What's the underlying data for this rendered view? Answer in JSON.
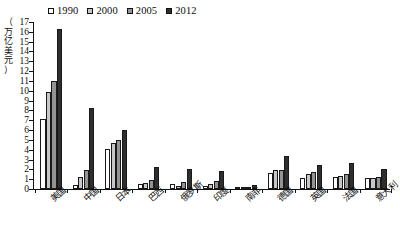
{
  "chart_data": {
    "type": "bar",
    "title": "",
    "subtitle": "",
    "xlabel": "",
    "ylabel": "（万亿美元）",
    "ylabel_chars": [
      "（",
      "万",
      "亿",
      "美",
      "元",
      "）"
    ],
    "ylim": [
      0,
      17
    ],
    "ytick_values": [
      0,
      1,
      2,
      3,
      4,
      5,
      6,
      7,
      8,
      9,
      10,
      11,
      12,
      13,
      14,
      15,
      16,
      17
    ],
    "ytick_labels": [
      "0",
      "1",
      "2",
      "3",
      "4",
      "5",
      "6",
      "7",
      "8",
      "9",
      "10",
      "11",
      "12",
      "13",
      "14",
      "15",
      "16",
      "17"
    ],
    "grid": false,
    "legend_position": "top",
    "categories": [
      "美国",
      "中国",
      "日本",
      "巴西",
      "俄罗斯",
      "印度",
      "南非",
      "德国",
      "英国",
      "法国",
      "意大利"
    ],
    "series": [
      {
        "name": "1990",
        "color": "#ffffff",
        "values": [
          7.1,
          0.4,
          4.1,
          0.5,
          0.52,
          0.33,
          0.11,
          1.6,
          1.1,
          1.27,
          1.14
        ]
      },
      {
        "name": "2000",
        "color": "#c7c7c7",
        "values": [
          9.9,
          1.2,
          4.7,
          0.65,
          0.26,
          0.47,
          0.13,
          1.9,
          1.5,
          1.33,
          1.14
        ]
      },
      {
        "name": "2005",
        "color": "#949494",
        "values": [
          11.0,
          1.9,
          5.0,
          0.89,
          0.76,
          0.82,
          0.25,
          1.9,
          1.7,
          1.5,
          1.25
        ]
      },
      {
        "name": "2012",
        "color": "#2e2e2e",
        "values": [
          16.3,
          8.2,
          6.0,
          2.25,
          2.0,
          1.82,
          0.38,
          3.4,
          2.45,
          2.6,
          2.0
        ]
      }
    ]
  },
  "legend": {
    "items": [
      {
        "label": "1990",
        "swatch": "legend-swatch-1990"
      },
      {
        "label": "2000",
        "swatch": "legend-swatch-2000"
      },
      {
        "label": "2005",
        "swatch": "legend-swatch-2005"
      },
      {
        "label": "2012",
        "swatch": "legend-swatch-2012"
      }
    ]
  }
}
